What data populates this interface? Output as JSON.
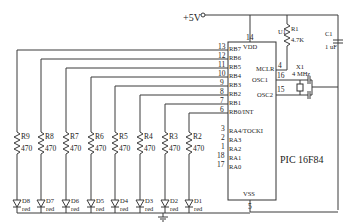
{
  "power": {
    "label": "+5V"
  },
  "ic": {
    "name": "PIC 16F84",
    "designator": "U1",
    "vdd": {
      "label": "VDD",
      "pin": "14"
    },
    "vss": {
      "label": "VSS",
      "pin": "5"
    },
    "mclr": {
      "label": "MCLR",
      "pin": "4"
    },
    "osc1": {
      "label": "OSC1",
      "pin": "16"
    },
    "osc2": {
      "label": "OSC2",
      "pin": "15"
    },
    "portb": [
      {
        "label": "RB7",
        "pin": "13"
      },
      {
        "label": "RB6",
        "pin": "12"
      },
      {
        "label": "RB5",
        "pin": "11"
      },
      {
        "label": "RB4",
        "pin": "10"
      },
      {
        "label": "RB3",
        "pin": "9"
      },
      {
        "label": "RB2",
        "pin": "8"
      },
      {
        "label": "RB1",
        "pin": "7"
      },
      {
        "label": "RB0/INT",
        "pin": "6"
      }
    ],
    "porta": [
      {
        "label": "RA4/TOCKI",
        "pin": "3"
      },
      {
        "label": "RA3",
        "pin": "2"
      },
      {
        "label": "RA2",
        "pin": "1"
      },
      {
        "label": "RA1",
        "pin": "18"
      },
      {
        "label": "RA0",
        "pin": "17"
      }
    ]
  },
  "r1": {
    "name": "R1",
    "value": "4.7K"
  },
  "c1": {
    "name": "C1",
    "value": "1 uF"
  },
  "x1": {
    "name": "X1",
    "value": "4 MHz"
  },
  "resistors": [
    {
      "name": "R9",
      "value": "470"
    },
    {
      "name": "R8",
      "value": "470"
    },
    {
      "name": "R7",
      "value": "470"
    },
    {
      "name": "R6",
      "value": "470"
    },
    {
      "name": "R5",
      "value": "470"
    },
    {
      "name": "R4",
      "value": "470"
    },
    {
      "name": "R3",
      "value": "470"
    },
    {
      "name": "R2",
      "value": "470"
    }
  ],
  "leds": [
    {
      "name": "D8",
      "color": "red"
    },
    {
      "name": "D7",
      "color": "red"
    },
    {
      "name": "D6",
      "color": "red"
    },
    {
      "name": "D5",
      "color": "red"
    },
    {
      "name": "D4",
      "color": "red"
    },
    {
      "name": "D3",
      "color": "red"
    },
    {
      "name": "D2",
      "color": "red"
    },
    {
      "name": "D1",
      "color": "red"
    }
  ],
  "led_pin_labels": {
    "top": "1",
    "bottom": "2"
  }
}
